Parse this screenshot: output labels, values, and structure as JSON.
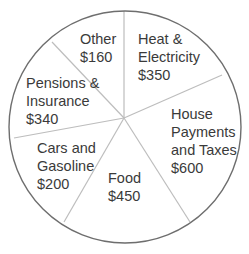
{
  "chart_data": {
    "type": "pie",
    "title": "",
    "slices": [
      {
        "label": "Heat & Electricity",
        "label_lines": [
          "Heat &",
          "Electricity",
          "$350"
        ],
        "value": 350
      },
      {
        "label": "House Payments and Taxes",
        "label_lines": [
          "House",
          "Payments",
          "and Taxes",
          "$600"
        ],
        "value": 600
      },
      {
        "label": "Food",
        "label_lines": [
          "Food",
          "$450"
        ],
        "value": 450
      },
      {
        "label": "Cars and Gasoline",
        "label_lines": [
          "Cars and",
          "Gasoline",
          "$200"
        ],
        "value": 200
      },
      {
        "label": "Pensions & Insurance",
        "label_lines": [
          "Pensions &",
          "Insurance",
          "$340"
        ],
        "value": 340
      },
      {
        "label": "Other",
        "label_lines": [
          "Other",
          "$160"
        ],
        "value": 160
      }
    ],
    "currency": "$",
    "legend": "none",
    "colors": {
      "fill": "#ffffff",
      "outline": "#6e6e6e",
      "separator": "#bdbdbd",
      "text": "#3a3a3a"
    }
  }
}
